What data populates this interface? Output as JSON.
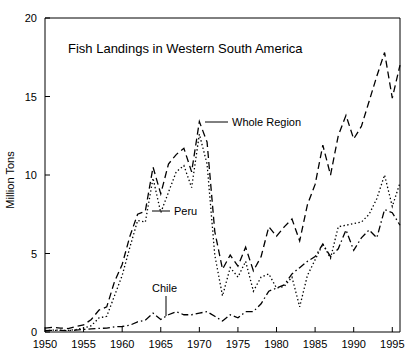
{
  "chart_data": {
    "type": "line",
    "title": "Fish Landings in Western South America",
    "xlabel": "",
    "ylabel": "Million Tons",
    "xlim": [
      1950,
      1996
    ],
    "ylim": [
      0,
      20
    ],
    "xticks": [
      1950,
      1955,
      1960,
      1965,
      1970,
      1975,
      1980,
      1985,
      1990,
      1995
    ],
    "yticks": [
      0,
      5,
      10,
      15,
      20
    ],
    "grid": false,
    "legend_position": "inline-annotations",
    "annotations": [
      {
        "text": "Whole Region",
        "series": "Whole Region",
        "point_year": 1970,
        "point_value": 13.4
      },
      {
        "text": "Peru",
        "series": "Peru",
        "point_year": 1965,
        "point_value": 7.6
      },
      {
        "text": "Chile",
        "series": "Chile",
        "point_year": 1966,
        "point_value": 1.1
      }
    ],
    "x": [
      1950,
      1951,
      1952,
      1953,
      1954,
      1955,
      1956,
      1957,
      1958,
      1959,
      1960,
      1961,
      1962,
      1963,
      1964,
      1965,
      1966,
      1967,
      1968,
      1969,
      1970,
      1971,
      1972,
      1973,
      1974,
      1975,
      1976,
      1977,
      1978,
      1979,
      1980,
      1981,
      1982,
      1983,
      1984,
      1985,
      1986,
      1987,
      1988,
      1989,
      1990,
      1991,
      1992,
      1993,
      1994,
      1995,
      1996
    ],
    "series": [
      {
        "name": "Whole Region",
        "style": "dashed",
        "values": [
          0.25,
          0.3,
          0.25,
          0.22,
          0.35,
          0.45,
          0.8,
          1.4,
          1.6,
          3.2,
          4.3,
          6.1,
          7.5,
          7.7,
          10.5,
          8.8,
          10.7,
          11.3,
          11.7,
          10.2,
          13.4,
          12.1,
          6.4,
          4.0,
          4.9,
          4.2,
          5.4,
          3.9,
          4.8,
          6.7,
          6.1,
          6.7,
          7.2,
          5.8,
          8.1,
          9.4,
          11.9,
          10.0,
          12.5,
          13.8,
          12.3,
          13.1,
          14.7,
          16.3,
          17.8,
          14.9,
          17.0
        ]
      },
      {
        "name": "Peru",
        "style": "dotted",
        "values": [
          0.09,
          0.12,
          0.11,
          0.1,
          0.15,
          0.25,
          0.4,
          0.9,
          1.0,
          2.3,
          3.6,
          5.4,
          7.1,
          7.0,
          9.8,
          7.6,
          8.9,
          10.2,
          10.6,
          9.2,
          12.6,
          10.7,
          4.9,
          2.3,
          4.1,
          3.5,
          4.5,
          2.6,
          3.5,
          3.7,
          2.8,
          2.9,
          3.5,
          1.6,
          3.6,
          4.6,
          5.6,
          4.7,
          6.7,
          6.8,
          6.9,
          7.0,
          7.5,
          8.5,
          10.0,
          8.0,
          9.5
        ]
      },
      {
        "name": "Chile",
        "style": "dashdot",
        "values": [
          0.09,
          0.11,
          0.1,
          0.09,
          0.12,
          0.16,
          0.2,
          0.23,
          0.25,
          0.33,
          0.35,
          0.43,
          0.65,
          0.75,
          1.2,
          0.8,
          1.1,
          1.3,
          1.1,
          1.1,
          1.2,
          1.3,
          1.0,
          0.7,
          1.1,
          0.9,
          1.3,
          1.3,
          1.8,
          2.6,
          2.8,
          3.0,
          3.7,
          4.1,
          4.5,
          4.8,
          5.6,
          4.8,
          5.3,
          6.5,
          5.2,
          6.0,
          6.5,
          6.0,
          7.8,
          7.6,
          6.8
        ]
      }
    ]
  },
  "ticks": {
    "x": [
      "1950",
      "1955",
      "1960",
      "1965",
      "1970",
      "1975",
      "1980",
      "1985",
      "1990",
      "1995"
    ],
    "y": [
      "0",
      "5",
      "10",
      "15",
      "20"
    ]
  },
  "labels": {
    "title": "Fish Landings in Western South America",
    "ylabel": "Million Tons",
    "whole_region": "Whole Region",
    "peru": "Peru",
    "chile": "Chile"
  }
}
